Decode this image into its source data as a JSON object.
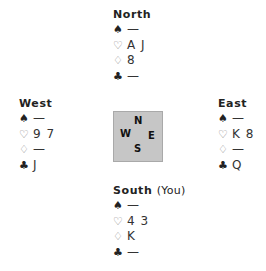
{
  "hands": {
    "north": {
      "name": "North",
      "suffix": "",
      "spades": "—",
      "hearts": "A J",
      "diamonds": "8",
      "clubs": "—"
    },
    "west": {
      "name": "West",
      "suffix": "",
      "spades": "—",
      "hearts": "9 7",
      "diamonds": "—",
      "clubs": "J"
    },
    "east": {
      "name": "East",
      "suffix": "",
      "spades": "—",
      "hearts": "K 8",
      "diamonds": "—",
      "clubs": "Q"
    },
    "south": {
      "name": "South",
      "suffix": "(You)",
      "spades": "—",
      "hearts": "4 3",
      "diamonds": "K",
      "clubs": "—"
    }
  },
  "suit_icons": {
    "spades": "♠",
    "hearts": "♡",
    "diamonds": "♢",
    "clubs": "♣"
  },
  "compass": {
    "n": "N",
    "w": "W",
    "e": "E",
    "s": "S"
  },
  "colors": {
    "compass_bg": "#c6c6c6",
    "compass_border": "#a9a9a9"
  }
}
